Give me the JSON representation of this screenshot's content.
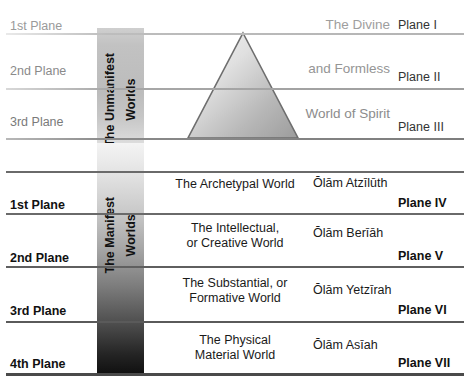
{
  "diagram": {
    "colors": {
      "rule_upper": "#a9a9a9",
      "rule_lower": "#555555",
      "triangle_stroke": "#6e6e6e",
      "triangle_fill_light": "#f2f2f2",
      "triangle_fill_dark": "#a3a3a3",
      "text_gray": "#9e9e9e",
      "text_black": "#111111"
    }
  },
  "unmanifest": {
    "column_label": "The Unmanifest\nWorlds",
    "shape": "triangle",
    "rows": [
      {
        "plane_left": "1st Plane",
        "description": "The Divine",
        "plane_right": "Plane I"
      },
      {
        "plane_left": "2nd Plane",
        "description": "and Formless",
        "plane_right": "Plane II"
      },
      {
        "plane_left": "3rd Plane",
        "description": "World of Spirit",
        "plane_right": "Plane III"
      }
    ]
  },
  "manifest": {
    "column_label": "The Manifest\nWorlds",
    "rows": [
      {
        "plane_left": "1st Plane",
        "world": "The Archetypal World",
        "olam": "Ōlām Atzīlūth",
        "plane_right": "Plane IV"
      },
      {
        "plane_left": "2nd Plane",
        "world": "The Intellectual,\nor Creative World",
        "olam": "Ōlām Berīāh",
        "plane_right": "Plane V"
      },
      {
        "plane_left": "3rd Plane",
        "world": "The Substantial, or\nFormative World",
        "olam": "Ōlām Yetzīrah",
        "plane_right": "Plane VI"
      },
      {
        "plane_left": "4th Plane",
        "world": "The Physical\nMaterial World",
        "olam": "Ōlām Asīah",
        "plane_right": "Plane VII"
      }
    ]
  }
}
